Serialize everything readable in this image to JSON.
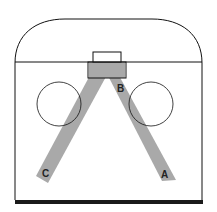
{
  "diagram": {
    "type": "hockey-rink-zone",
    "colors": {
      "line": "#111111",
      "lane": "#a9a9a9",
      "background": "#ffffff",
      "baseline": "#1a1a1a"
    },
    "labels": {
      "a": "A",
      "b": "B",
      "c": "C"
    }
  }
}
